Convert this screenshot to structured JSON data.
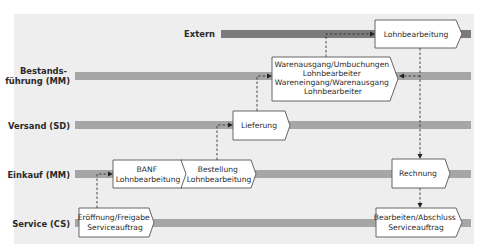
{
  "colors": {
    "background": "#ffffff",
    "panel": "#eeeeee",
    "lane_bar": "#a6a6a6",
    "lane_bar_extern": "#7b7b7b",
    "step_fill": "#ffffff",
    "step_border": "#555555",
    "text": "#2a2a2a",
    "flow_line": "#333333"
  },
  "lanes": [
    {
      "id": "extern",
      "label_lines": [
        "Extern"
      ]
    },
    {
      "id": "bestand",
      "label_lines": [
        "Bestands-",
        "führung (MM)"
      ]
    },
    {
      "id": "versand",
      "label_lines": [
        "Versand (SD)"
      ]
    },
    {
      "id": "einkauf",
      "label_lines": [
        "Einkauf (MM)"
      ]
    },
    {
      "id": "service",
      "label_lines": [
        "Service (CS)"
      ]
    }
  ],
  "steps": [
    {
      "id": "eroeffnung",
      "lane": "service",
      "lines": [
        "Eröffnung/Freigabe",
        "Serviceauftrag"
      ]
    },
    {
      "id": "banf",
      "lane": "einkauf",
      "lines": [
        "BANF",
        "Lohnbearbeitung"
      ]
    },
    {
      "id": "bestellung",
      "lane": "einkauf",
      "lines": [
        "Bestellung",
        "Lohnbearbeitung"
      ]
    },
    {
      "id": "lieferung",
      "lane": "versand",
      "lines": [
        "Lieferung"
      ]
    },
    {
      "id": "warenausgang",
      "lane": "bestand",
      "lines": [
        "Warenausgang/Umbuchungen",
        "Lohnbearbeiter",
        "Wareneingang/Warenausgang",
        "Lohnbearbeiter"
      ]
    },
    {
      "id": "lohnbearbeitung",
      "lane": "extern",
      "lines": [
        "Lohnbearbeitung"
      ]
    },
    {
      "id": "rechnung",
      "lane": "einkauf",
      "lines": [
        "Rechnung"
      ]
    },
    {
      "id": "bearbeiten",
      "lane": "service",
      "lines": [
        "Bearbeiten/Abschluss",
        "Serviceauftrag"
      ]
    }
  ],
  "flows": [
    {
      "from": "eroeffnung",
      "to": "banf"
    },
    {
      "from": "bestellung",
      "to": "lieferung"
    },
    {
      "from": "lieferung",
      "to": "warenausgang"
    },
    {
      "from": "warenausgang",
      "to": "lohnbearbeitung"
    },
    {
      "from": "lohnbearbeitung",
      "to": "warenausgang"
    },
    {
      "from": "lohnbearbeitung",
      "to": "rechnung"
    },
    {
      "from": "rechnung",
      "to": "bearbeiten"
    }
  ]
}
